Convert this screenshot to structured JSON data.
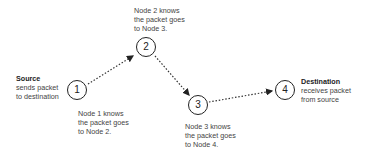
{
  "diagram": {
    "nodes": [
      {
        "id": "1",
        "label": "1",
        "x": 77,
        "y": 90
      },
      {
        "id": "2",
        "label": "2",
        "x": 146,
        "y": 47
      },
      {
        "id": "3",
        "label": "3",
        "x": 198,
        "y": 105
      },
      {
        "id": "4",
        "label": "4",
        "x": 285,
        "y": 90
      }
    ],
    "edges": [
      {
        "from": "1",
        "to": "2",
        "style": "dotted-arrow"
      },
      {
        "from": "2",
        "to": "3",
        "style": "dotted-arrow"
      },
      {
        "from": "3",
        "to": "4",
        "style": "dotted-arrow"
      }
    ],
    "source": {
      "title": "Source",
      "line1": "sends packet",
      "line2": "to destination"
    },
    "destination": {
      "title": "Destination",
      "line1": "receives packet",
      "line2": "from source"
    },
    "annotations": {
      "node1": {
        "line1": "Node 1 knows",
        "line2": "the packet goes",
        "line3": "to Node 2."
      },
      "node2": {
        "line1": "Node 2 knows",
        "line2": "the packet goes",
        "line3": "to Node 3."
      },
      "node3": {
        "line1": "Node 3 knows",
        "line2": "the packet goes",
        "line3": "to Node 4."
      }
    }
  }
}
